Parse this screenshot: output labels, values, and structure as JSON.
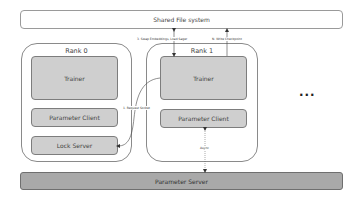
{
  "shared_fs": {
    "label": "Shared File system"
  },
  "ranks": [
    {
      "title": "Rank 0",
      "components": [
        "Trainer",
        "Parameter Client",
        "Lock Server"
      ]
    },
    {
      "title": "Rank 1",
      "components": [
        "Trainer",
        "Parameter Client"
      ]
    }
  ],
  "parameter_server": {
    "label": "Parameter Server"
  },
  "edges": {
    "swap": "3. Swap Embeddings, Load Sager",
    "checkpoint": "N. Write Checkpoint",
    "request_socket": "1. Request Socket",
    "async": "Async"
  },
  "more_indicator": "..."
}
